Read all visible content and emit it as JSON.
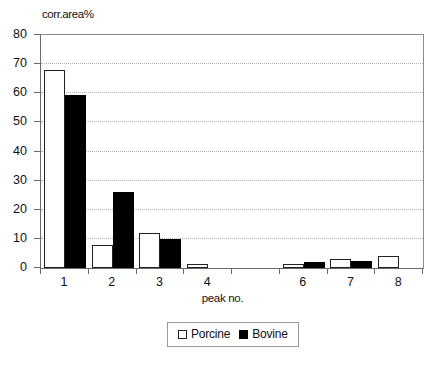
{
  "chart_data": {
    "type": "bar",
    "title": "",
    "subtitle": "",
    "xlabel": "peak no.",
    "ylabel": "corr.area%",
    "categories": [
      "1",
      "2",
      "3",
      "4",
      "5",
      "6",
      "7",
      "8"
    ],
    "visible_tick_labels": [
      "1",
      "2",
      "3",
      "4",
      "",
      "6",
      "7",
      "8"
    ],
    "series": [
      {
        "name": "Porcine",
        "color": "#ffffff",
        "edge_color": "#222222",
        "values": [
          68,
          8,
          12,
          1.5,
          0,
          1.5,
          3,
          4
        ]
      },
      {
        "name": "Bovine",
        "color": "#000000",
        "edge_color": "#000000",
        "values": [
          59.5,
          26,
          10,
          0,
          0,
          2,
          2.5,
          0
        ]
      }
    ],
    "ylim": [
      0,
      80
    ],
    "yticks": [
      0,
      10,
      20,
      30,
      40,
      50,
      60,
      70,
      80
    ],
    "ytick_labels": [
      "0",
      "10",
      "20",
      "30",
      "40",
      "50",
      "60",
      "70",
      "80"
    ],
    "grid": true,
    "grid_axis": "y",
    "grid_style": "dotted",
    "legend_position": "bottom-center",
    "legend_entries": [
      "Porcine",
      "Bovine"
    ]
  },
  "axes": {
    "y_title": "corr.area%",
    "x_title": "peak no."
  },
  "legend": {
    "items": [
      {
        "label": "Porcine",
        "swatch": "open-square"
      },
      {
        "label": "Bovine",
        "swatch": "filled-square"
      }
    ]
  },
  "caption": {
    "text": ""
  }
}
